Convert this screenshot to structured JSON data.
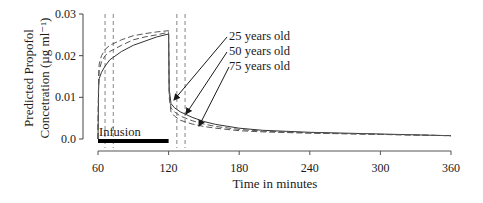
{
  "chart_data": {
    "type": "line",
    "title": "",
    "xlabel": "Time in minutes",
    "ylabel_line1": "Predicted Propofol",
    "ylabel_line2": "Concetration (µg ml⁻¹)",
    "xlim": [
      60,
      360
    ],
    "ylim": [
      0,
      0.03
    ],
    "xticks": [
      60,
      120,
      180,
      240,
      300,
      360
    ],
    "xtick_labels": [
      "60",
      "120",
      "180",
      "240",
      "300",
      "360"
    ],
    "yticks": [
      0.0,
      0.01,
      0.02,
      0.03
    ],
    "ytick_labels": [
      "0.0",
      "0.01",
      "0.02",
      "0.03"
    ],
    "grid": false,
    "annotations": {
      "infusion_label": "Infusion",
      "infusion_start": 60,
      "infusion_end": 120,
      "dashed_vertical_lines_x": [
        66,
        73,
        127,
        134
      ]
    },
    "legend": [
      "25 years old",
      "50 years old",
      "75 years old"
    ],
    "series": [
      {
        "name": "25 years old",
        "style": "solid",
        "x": [
          60,
          60.5,
          61,
          63,
          66,
          70,
          80,
          90,
          100,
          110,
          120,
          120.5,
          122,
          125,
          130,
          140,
          150,
          160,
          180,
          200,
          240,
          300,
          360
        ],
        "y": [
          0.0,
          0.012,
          0.0145,
          0.016,
          0.0175,
          0.019,
          0.021,
          0.0225,
          0.0235,
          0.0245,
          0.0252,
          0.012,
          0.0085,
          0.0075,
          0.0065,
          0.0052,
          0.0042,
          0.0035,
          0.0026,
          0.0021,
          0.0016,
          0.0012,
          0.0008
        ]
      },
      {
        "name": "50 years old",
        "style": "dashed",
        "x": [
          60,
          60.5,
          61,
          63,
          66,
          70,
          80,
          90,
          100,
          110,
          120,
          120.5,
          122,
          125,
          130,
          140,
          150,
          160,
          180,
          200,
          240,
          300,
          360
        ],
        "y": [
          0.0,
          0.014,
          0.0165,
          0.0185,
          0.02,
          0.021,
          0.0225,
          0.0238,
          0.0245,
          0.025,
          0.0256,
          0.011,
          0.0075,
          0.0065,
          0.0055,
          0.0044,
          0.0036,
          0.003,
          0.0023,
          0.0019,
          0.0015,
          0.0011,
          0.0008
        ]
      },
      {
        "name": "75 years old",
        "style": "dashed",
        "x": [
          60,
          60.5,
          61,
          63,
          66,
          70,
          80,
          90,
          100,
          110,
          120,
          120.5,
          122,
          125,
          130,
          140,
          150,
          160,
          180,
          200,
          240,
          300,
          360
        ],
        "y": [
          0.0,
          0.015,
          0.018,
          0.02,
          0.0215,
          0.0225,
          0.0238,
          0.0248,
          0.0253,
          0.0257,
          0.026,
          0.01,
          0.0065,
          0.0055,
          0.0045,
          0.0036,
          0.003,
          0.0026,
          0.002,
          0.0017,
          0.0014,
          0.0011,
          0.0008
        ]
      }
    ]
  }
}
